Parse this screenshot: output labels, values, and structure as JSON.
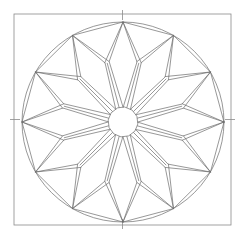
{
  "figure": {
    "name": "twelve-point-rosette",
    "background_color": "#ffffff",
    "canvas": {
      "width": 245,
      "height": 238
    }
  },
  "style": {
    "line_color": "#6b6b6b",
    "frame_color": "#8a8a8a",
    "line_width": 0.7,
    "frame_width": 0.8,
    "fill": "none"
  },
  "chart_data": {
    "type": "diagram",
    "geometry": {
      "center": {
        "x": 123,
        "y": 122
      },
      "square": {
        "x": 14,
        "y": 14,
        "width": 217,
        "height": 211
      },
      "tick_marks": {
        "count": 4,
        "length": 9,
        "positions": [
          "top-center",
          "bottom-center",
          "left-middle",
          "right-middle"
        ]
      },
      "outer_circle": {
        "cx": 123,
        "cy": 122,
        "rx": 101,
        "ry": 100
      },
      "hub_circle": {
        "cx": 123,
        "cy": 122,
        "r": 15,
        "sides": 12
      },
      "points": 12,
      "petal_tip_radius": 100,
      "petal_shoulder_radius": 62,
      "chord_point_radius": 100,
      "inner_ring_radius": 15,
      "angle_step_degrees": 30,
      "start_angle_degrees": -90
    },
    "elements": [
      "square-frame",
      "four-edge-tick-marks",
      "outer-circle",
      "twelve-petals",
      "twelve-chords",
      "twelve-spokes",
      "central-hub-polygon"
    ]
  }
}
